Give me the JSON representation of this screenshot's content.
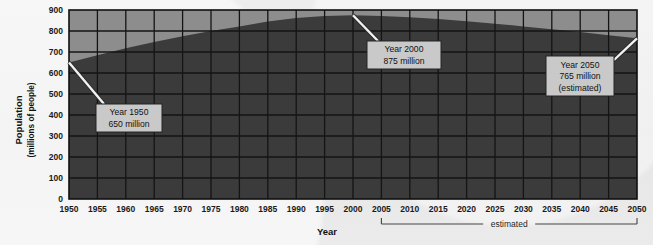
{
  "chart_data": {
    "type": "area",
    "title": "",
    "xlabel": "Year",
    "ylabel": "Population",
    "ylabel_sub": "(millions of people)",
    "ylim": [
      0,
      900
    ],
    "xlim": [
      1950,
      2050
    ],
    "y_ticks": [
      0,
      100,
      200,
      300,
      400,
      500,
      600,
      700,
      800,
      900
    ],
    "x_ticks": [
      1950,
      1955,
      1960,
      1965,
      1970,
      1975,
      1980,
      1985,
      1990,
      1995,
      2000,
      2005,
      2010,
      2015,
      2020,
      2025,
      2030,
      2035,
      2040,
      2045,
      2050
    ],
    "grid": true,
    "legend": "none",
    "series": [
      {
        "name": "Population",
        "x": [
          1950,
          1955,
          1960,
          1965,
          1970,
          1975,
          1980,
          1985,
          1990,
          1995,
          2000,
          2005,
          2010,
          2015,
          2020,
          2025,
          2030,
          2035,
          2040,
          2045,
          2050
        ],
        "values": [
          650,
          685,
          718,
          748,
          775,
          800,
          822,
          845,
          862,
          872,
          875,
          872,
          866,
          857,
          847,
          835,
          822,
          808,
          795,
          780,
          765
        ]
      }
    ],
    "annotations": [
      {
        "id": "year-1950",
        "lines": [
          "Year 1950",
          "650 million"
        ],
        "point_x": 1950,
        "point_y": 650
      },
      {
        "id": "year-2000",
        "lines": [
          "Year 2000",
          "875 million"
        ],
        "point_x": 2000,
        "point_y": 875
      },
      {
        "id": "year-2050",
        "lines": [
          "Year 2050",
          "765 million",
          "(estimated)"
        ],
        "point_x": 2050,
        "point_y": 765
      }
    ],
    "bracket": {
      "label": "estimated",
      "from_x": 2005,
      "to_x": 2050
    },
    "colors": {
      "page_background": "#e9e9e9",
      "plot_background": "#8d8d8d",
      "area_fill": "#3b3b3b",
      "gridline": "#141414",
      "axis_text": "#1a1a1a",
      "callout_fill": "#c9c9c9",
      "callout_border": "#2a2a2a",
      "leader_line": "#f2f2f2"
    }
  }
}
